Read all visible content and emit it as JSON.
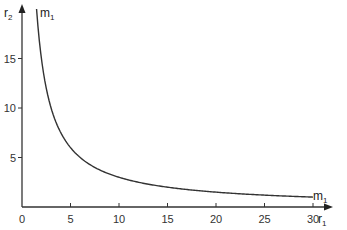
{
  "chart_data": {
    "type": "line",
    "title": "",
    "xlabel": "r1",
    "ylabel": "r2",
    "xlabel_main": "r",
    "xlabel_sub": "1",
    "ylabel_main": "r",
    "ylabel_sub": "2",
    "xlim": [
      0,
      32
    ],
    "ylim": [
      0,
      20
    ],
    "x_ticks": [
      0,
      5,
      10,
      15,
      20,
      25,
      30
    ],
    "y_ticks": [
      5,
      10,
      15
    ],
    "x_tick_labels": [
      "0",
      "5",
      "10",
      "15",
      "20",
      "25",
      "30"
    ],
    "y_tick_labels": [
      "5",
      "10",
      "15"
    ],
    "grid": false,
    "legend": "none",
    "series": [
      {
        "name": "m1",
        "x": [
          1.5,
          2,
          2.5,
          3,
          4,
          5,
          6,
          8,
          10,
          12,
          15,
          20,
          25,
          30
        ],
        "values": [
          20,
          15,
          12,
          10,
          7.5,
          6,
          5,
          3.75,
          3,
          2.5,
          2,
          1.5,
          1.2,
          1
        ]
      }
    ],
    "annotations": [
      {
        "text": "m1",
        "main": "m",
        "sub": "1",
        "position": "top",
        "at": [
          2.0,
          19.5
        ]
      },
      {
        "text": "m1",
        "main": "m",
        "sub": "1",
        "position": "right end",
        "at": [
          31,
          1.2
        ]
      }
    ],
    "colors": {
      "line": "#333333",
      "axis": "#333333",
      "background": "#ffffff"
    }
  }
}
